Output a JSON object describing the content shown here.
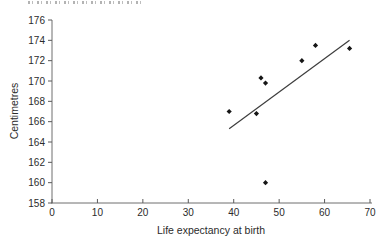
{
  "figure": {
    "background": "#ffffff",
    "top_fragment_present": true
  },
  "chart_data": {
    "type": "scatter",
    "title": "",
    "xlabel": "Life expectancy at birth",
    "ylabel": "Centimetres",
    "xlim": [
      0,
      70
    ],
    "ylim": [
      158,
      176
    ],
    "xticks": [
      0,
      10,
      20,
      30,
      40,
      50,
      60,
      70
    ],
    "yticks": [
      158,
      160,
      162,
      164,
      166,
      168,
      170,
      172,
      174,
      176
    ],
    "grid": false,
    "legend_position": "none",
    "marker": "diamond",
    "points": [
      {
        "x": 39,
        "y": 167
      },
      {
        "x": 45,
        "y": 166.8
      },
      {
        "x": 46,
        "y": 170.3
      },
      {
        "x": 47,
        "y": 169.8
      },
      {
        "x": 47,
        "y": 160
      },
      {
        "x": 55,
        "y": 172
      },
      {
        "x": 58,
        "y": 173.5
      },
      {
        "x": 65.5,
        "y": 173.2
      }
    ],
    "trend_line": {
      "x1": 39,
      "y1": 165.3,
      "x2": 65.5,
      "y2": 174
    },
    "colors": {
      "axis": "#6e6e6e",
      "tick": "#5a5a5a",
      "tick_label": "#2b2b2b",
      "point": "#161616",
      "trend": "#3d3d3d"
    }
  }
}
